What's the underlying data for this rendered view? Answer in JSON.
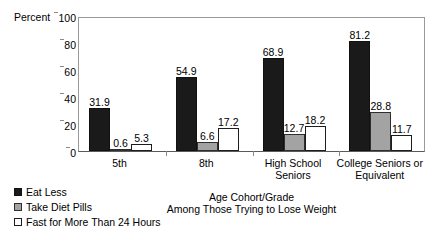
{
  "chart_data": {
    "type": "bar",
    "title": "",
    "xlabel": "Age Cohort/Grade",
    "xlabel_line2": "Among Those Trying to Lose Weight",
    "ylabel": "Percent",
    "ylim": [
      0,
      100
    ],
    "yticks": [
      0,
      20,
      40,
      60,
      80,
      100
    ],
    "ytick_labels": [
      "0",
      "20",
      "40",
      "60",
      "80",
      "100"
    ],
    "grid": false,
    "legend_position": "bottom-left",
    "categories": [
      "5th",
      "8th",
      "High School Seniors",
      "College Seniors or Equivalent"
    ],
    "category_lines": [
      [
        "5th"
      ],
      [
        "8th"
      ],
      [
        "High School",
        "Seniors"
      ],
      [
        "College Seniors or",
        "Equivalent"
      ]
    ],
    "series": [
      {
        "name": "Eat Less",
        "color": "#1a1a1a",
        "values": [
          31.9,
          54.9,
          68.9,
          81.2
        ],
        "labels": [
          "31.9",
          "54.9",
          "68.9",
          "81.2"
        ]
      },
      {
        "name": "Take Diet Pills",
        "color": "#a3a3a3",
        "values": [
          0.6,
          6.6,
          12.7,
          28.8
        ],
        "labels": [
          "0.6",
          "6.6",
          "12.7",
          "28.8"
        ]
      },
      {
        "name": "Fast for More Than 24 Hours",
        "color": "#ffffff",
        "values": [
          5.3,
          17.2,
          18.2,
          11.7
        ],
        "labels": [
          "5.3",
          "17.2",
          "18.2",
          "11.7"
        ]
      }
    ]
  },
  "legend": {
    "items": [
      {
        "label": "Eat Less",
        "swatch": "s-eat"
      },
      {
        "label": "Take Diet Pills",
        "swatch": "s-pills"
      },
      {
        "label": "Fast for More Than 24 Hours",
        "swatch": "s-fast"
      }
    ]
  }
}
